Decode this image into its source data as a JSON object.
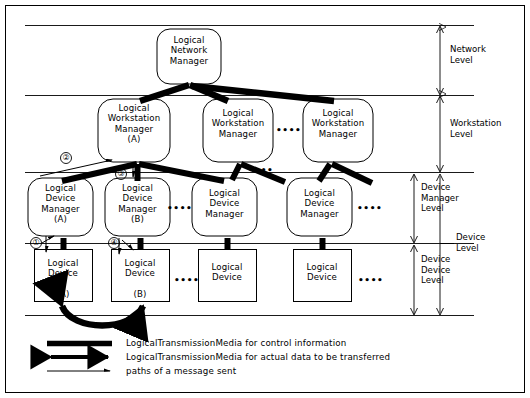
{
  "figure": {
    "type": "hierarchical-architecture-diagram",
    "background": "#ffffff",
    "ink": "#000000"
  },
  "nodes": {
    "network_manager": {
      "label": "Logical\nNetwork\nManager"
    },
    "workstation_managers": [
      {
        "label": "Logical\nWorkstation\nManager\n(A)"
      },
      {
        "label": "Logical\nWorkstation\nManager"
      },
      {
        "label": "Logical\nWorkstation\nManager"
      }
    ],
    "device_managers": [
      {
        "label": "Logical\nDevice\nManager\n(A)"
      },
      {
        "label": "Logical\nDevice\nManager\n(B)"
      },
      {
        "label": "Logical\nDevice\nManager"
      },
      {
        "label": "Logical\nDevice\nManager"
      }
    ],
    "devices": [
      {
        "label": "Logical\nDevice\n\n(A)"
      },
      {
        "label": "Logical\nDevice\n\n(B)"
      },
      {
        "label": "Logical\nDevice"
      },
      {
        "label": "Logical\nDevice"
      }
    ]
  },
  "ellipses": {
    "glyph": "••••",
    "positions": [
      "between-workstation-manager-2-and-3",
      "below-workstation-manager-2",
      "between-device-manager-2-and-3",
      "right-of-device-manager-4",
      "between-device-2-and-3",
      "right-of-device-4"
    ]
  },
  "levels": [
    {
      "name": "network",
      "label": "Network\nLevel"
    },
    {
      "name": "workstation",
      "label": "Workstation\nLevel"
    },
    {
      "name": "device-manager",
      "label": "Device\nManager\nLevel"
    },
    {
      "name": "device",
      "label": "Device\nLevel"
    },
    {
      "name": "device-device",
      "label": "Device\nDevice\nLevel"
    }
  ],
  "markers": [
    {
      "id": "1",
      "glyph": "①"
    },
    {
      "id": "2",
      "glyph": "②"
    },
    {
      "id": "3",
      "glyph": "③"
    },
    {
      "id": "4",
      "glyph": "④"
    }
  ],
  "legend": {
    "items": [
      {
        "symbol": "thick-bar",
        "text": "LogicalTransmissionMedia for control information"
      },
      {
        "symbol": "double-headed-arrow",
        "text": "LogicalTransmissionMedia for actual data to be transferred"
      },
      {
        "symbol": "thin-arrow",
        "text": "paths of a message sent"
      }
    ]
  }
}
